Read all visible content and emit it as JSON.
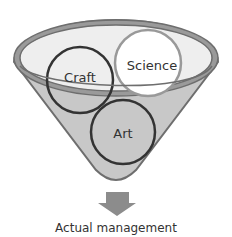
{
  "diagram": {
    "circles": [
      {
        "id": "craft",
        "label": "Craft",
        "stroke": "#333333",
        "fill": "none"
      },
      {
        "id": "science",
        "label": "Science",
        "stroke": "#999999",
        "fill": "#ffffff"
      },
      {
        "id": "art",
        "label": "Art",
        "stroke": "#333333",
        "fill": "none"
      }
    ],
    "output_label": "Actual management",
    "colors": {
      "funnel_fill": "#c8c8c8",
      "funnel_stroke": "#6e6e6e",
      "rim_inner": "#eeeeee",
      "arrow": "#8c8c8c",
      "text": "#333333"
    }
  }
}
